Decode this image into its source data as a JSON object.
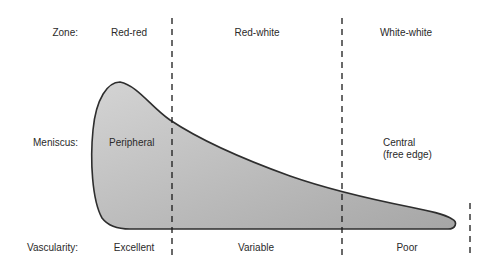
{
  "diagram": {
    "rows": {
      "zone": {
        "label": "Zone:",
        "values": [
          "Red-red",
          "Red-white",
          "White-white"
        ]
      },
      "meniscus": {
        "label": "Meniscus:",
        "peripheral": "Peripheral",
        "central_line1": "Central",
        "central_line2": "(free edge)"
      },
      "vascularity": {
        "label": "Vascularity:",
        "values": [
          "Excellent",
          "Variable",
          "Poor"
        ]
      }
    },
    "colors": {
      "fill_light": "#d2d2d2",
      "fill_dark": "#a8a8a8",
      "outline": "#2e2e2e",
      "divider": "#1a1a1a",
      "text": "#2a2a2a"
    }
  }
}
